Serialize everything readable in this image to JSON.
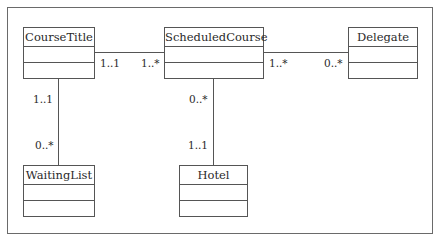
{
  "diagram": {
    "type": "uml-class-diagram",
    "classes": [
      {
        "id": "CourseTitle",
        "name": "CourseTitle",
        "attributes": [],
        "operations": []
      },
      {
        "id": "ScheduledCourse",
        "name": "ScheduledCourse",
        "attributes": [],
        "operations": []
      },
      {
        "id": "Delegate",
        "name": "Delegate",
        "attributes": [],
        "operations": []
      },
      {
        "id": "WaitingList",
        "name": "WaitingList",
        "attributes": [],
        "operations": []
      },
      {
        "id": "Hotel",
        "name": "Hotel",
        "attributes": [],
        "operations": []
      }
    ],
    "associations": [
      {
        "from": "CourseTitle",
        "to": "ScheduledCourse",
        "from_mult": "1..1",
        "to_mult": "1..*"
      },
      {
        "from": "ScheduledCourse",
        "to": "Delegate",
        "from_mult": "1..*",
        "to_mult": "0..*"
      },
      {
        "from": "CourseTitle",
        "to": "WaitingList",
        "from_mult": "1..1",
        "to_mult": "0..*"
      },
      {
        "from": "ScheduledCourse",
        "to": "Hotel",
        "from_mult": "0..*",
        "to_mult": "1..1"
      }
    ]
  },
  "colors": {
    "line": "#555555",
    "text": "#2a2a2a",
    "background": "#ffffff"
  }
}
